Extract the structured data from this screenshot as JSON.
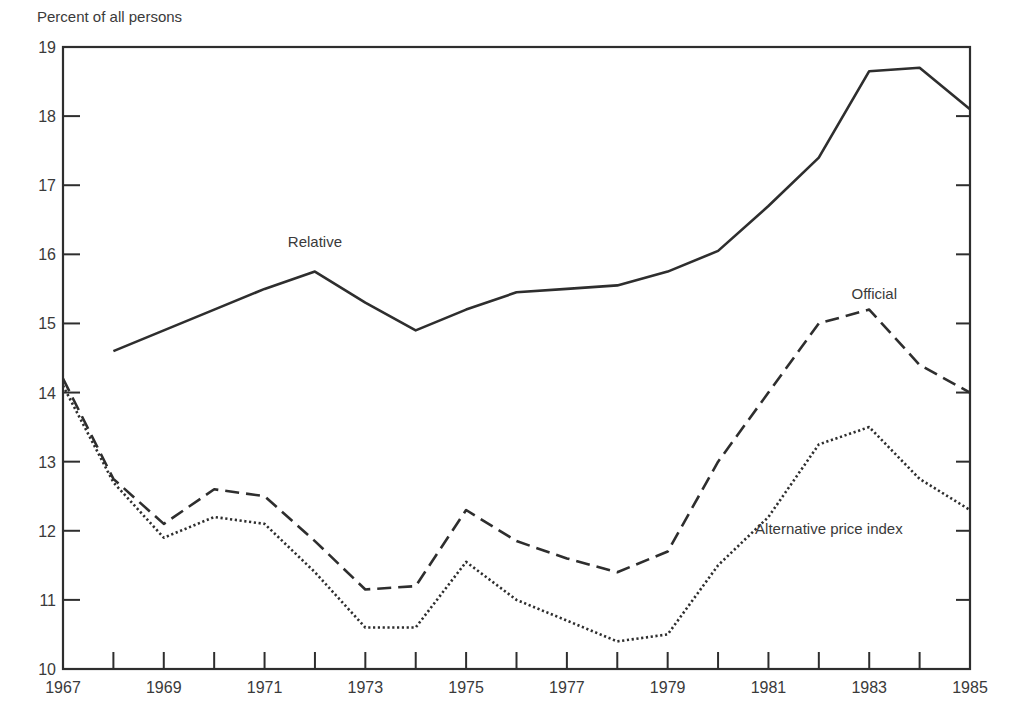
{
  "chart_data": {
    "type": "line",
    "title": "",
    "ylabel": "Percent of all persons",
    "xlabel": "",
    "ylim": [
      10,
      19
    ],
    "xlim": [
      1967,
      1985
    ],
    "grid": false,
    "legend": "inline labels",
    "x": [
      1967,
      1968,
      1969,
      1970,
      1971,
      1972,
      1973,
      1974,
      1975,
      1976,
      1977,
      1978,
      1979,
      1980,
      1981,
      1982,
      1983,
      1984,
      1985
    ],
    "x_tick_labels": [
      "1967",
      "1969",
      "1971",
      "1973",
      "1975",
      "1977",
      "1979",
      "1981",
      "1983",
      "1985"
    ],
    "y_tick_labels": [
      "10",
      "11",
      "12",
      "13",
      "14",
      "15",
      "16",
      "17",
      "18",
      "19"
    ],
    "series": [
      {
        "name": "Relative",
        "style": "solid",
        "label_pos": {
          "x": 1972,
          "y": 16.1
        },
        "values": [
          null,
          14.6,
          14.9,
          15.2,
          15.5,
          15.75,
          15.3,
          14.9,
          15.2,
          15.45,
          15.5,
          15.55,
          15.75,
          16.05,
          16.7,
          17.4,
          18.65,
          18.7,
          18.1
        ]
      },
      {
        "name": "Official",
        "style": "dashed",
        "label_pos": {
          "x": 1983.1,
          "y": 15.35
        },
        "values": [
          14.2,
          12.75,
          12.1,
          12.6,
          12.5,
          11.85,
          11.15,
          11.2,
          12.3,
          11.85,
          11.6,
          11.4,
          11.7,
          13.0,
          14.0,
          15.0,
          15.2,
          14.4,
          14.0
        ]
      },
      {
        "name": "Alternative price index",
        "style": "dotted",
        "label_pos": {
          "x": 1982.2,
          "y": 11.95
        },
        "values": [
          14.1,
          12.7,
          11.9,
          12.2,
          12.1,
          11.4,
          10.6,
          10.6,
          11.55,
          11.0,
          10.7,
          10.4,
          10.5,
          11.5,
          12.2,
          13.25,
          13.5,
          12.75,
          12.3
        ]
      }
    ]
  }
}
